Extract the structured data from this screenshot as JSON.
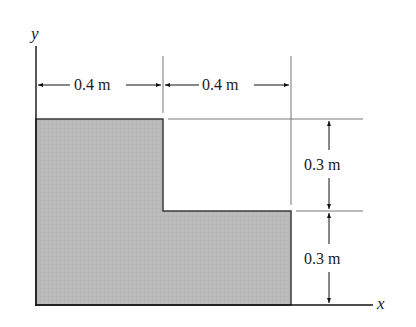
{
  "figure": {
    "type": "engineering-dimension-drawing",
    "axes": {
      "x_label": "x",
      "y_label": "y"
    },
    "shape": {
      "name": "L-shaped area",
      "fill_color": "#b9b9b9",
      "outline_color": "#333333"
    },
    "dimensions": {
      "top_left_width": "0.4 m",
      "top_right_width": "0.4 m",
      "right_upper_height": "0.3 m",
      "right_lower_height": "0.3 m"
    }
  }
}
